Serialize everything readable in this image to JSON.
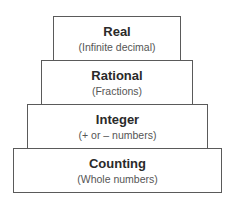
{
  "diagram": {
    "type": "stacked-pyramid",
    "tiers": [
      {
        "title": "Real",
        "subtitle": "(Infinite decimal)"
      },
      {
        "title": "Rational",
        "subtitle": "(Fractions)"
      },
      {
        "title": "Integer",
        "subtitle": "(+ or – numbers)"
      },
      {
        "title": "Counting",
        "subtitle": "(Whole numbers)"
      }
    ],
    "colors": {
      "border": "#5a5a5a",
      "title": "#2a2a2a",
      "subtitle": "#555555",
      "background": "#ffffff"
    }
  }
}
